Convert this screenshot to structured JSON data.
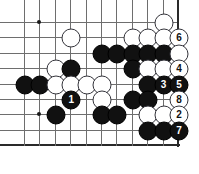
{
  "diagram": {
    "kind": "go-board-problem-diagram",
    "board": {
      "columns": 11,
      "rows": 9,
      "grid_spacing_px": 15.4,
      "origin": {
        "x": 24,
        "y": 22
      },
      "right_edge_is_board_border": true,
      "bottom_edge_is_board_border": true,
      "line_color": "#6e6e6e",
      "edge_color": "#2a2a2a",
      "background_color": "#ffffff"
    },
    "star_points": [
      {
        "col": 1,
        "row": 0
      },
      {
        "col": 1,
        "row": 6
      }
    ],
    "colors": {
      "black_stone": "#111111",
      "white_stone": "#ffffff",
      "white_stone_border": "#33333a",
      "black_label_text": "#ffffff",
      "white_label_text": "#111111"
    },
    "stones": [
      {
        "col": 9,
        "row": 0,
        "color": "white",
        "label": ""
      },
      {
        "col": 3,
        "row": 1,
        "color": "white",
        "label": ""
      },
      {
        "col": 7,
        "row": 1,
        "color": "white",
        "label": ""
      },
      {
        "col": 8,
        "row": 1,
        "color": "white",
        "label": ""
      },
      {
        "col": 9,
        "row": 1,
        "color": "white",
        "label": ""
      },
      {
        "col": 10,
        "row": 1,
        "color": "white",
        "label": "6"
      },
      {
        "col": 5,
        "row": 2,
        "color": "black",
        "label": ""
      },
      {
        "col": 6,
        "row": 2,
        "color": "black",
        "label": ""
      },
      {
        "col": 7,
        "row": 2,
        "color": "black",
        "label": ""
      },
      {
        "col": 8,
        "row": 2,
        "color": "black",
        "label": ""
      },
      {
        "col": 9,
        "row": 2,
        "color": "black",
        "label": ""
      },
      {
        "col": 10,
        "row": 2,
        "color": "white",
        "label": ""
      },
      {
        "col": 2,
        "row": 3,
        "color": "white",
        "label": ""
      },
      {
        "col": 3,
        "row": 3,
        "color": "black",
        "label": ""
      },
      {
        "col": 7,
        "row": 3,
        "color": "black",
        "label": ""
      },
      {
        "col": 8,
        "row": 3,
        "color": "white",
        "label": ""
      },
      {
        "col": 9,
        "row": 3,
        "color": "white",
        "label": ""
      },
      {
        "col": 10,
        "row": 3,
        "color": "white",
        "label": "4"
      },
      {
        "col": 0,
        "row": 4,
        "color": "black",
        "label": ""
      },
      {
        "col": 1,
        "row": 4,
        "color": "black",
        "label": ""
      },
      {
        "col": 2,
        "row": 4,
        "color": "white",
        "label": ""
      },
      {
        "col": 3,
        "row": 4,
        "color": "white",
        "label": ""
      },
      {
        "col": 4,
        "row": 4,
        "color": "white",
        "label": ""
      },
      {
        "col": 5,
        "row": 4,
        "color": "white",
        "label": ""
      },
      {
        "col": 8,
        "row": 4,
        "color": "black",
        "label": ""
      },
      {
        "col": 9,
        "row": 4,
        "color": "black",
        "label": "3"
      },
      {
        "col": 10,
        "row": 4,
        "color": "black",
        "label": "5"
      },
      {
        "col": 3,
        "row": 5,
        "color": "black",
        "label": "1"
      },
      {
        "col": 5,
        "row": 5,
        "color": "white",
        "label": ""
      },
      {
        "col": 7,
        "row": 5,
        "color": "black",
        "label": ""
      },
      {
        "col": 8,
        "row": 5,
        "color": "black",
        "label": ""
      },
      {
        "col": 10,
        "row": 5,
        "color": "white",
        "label": "8"
      },
      {
        "col": 2,
        "row": 6,
        "color": "black",
        "label": ""
      },
      {
        "col": 5,
        "row": 6,
        "color": "black",
        "label": ""
      },
      {
        "col": 6,
        "row": 6,
        "color": "black",
        "label": ""
      },
      {
        "col": 8,
        "row": 6,
        "color": "white",
        "label": ""
      },
      {
        "col": 9,
        "row": 6,
        "color": "white",
        "label": ""
      },
      {
        "col": 10,
        "row": 6,
        "color": "white",
        "label": "2"
      },
      {
        "col": 8,
        "row": 7,
        "color": "black",
        "label": ""
      },
      {
        "col": 9,
        "row": 7,
        "color": "black",
        "label": ""
      },
      {
        "col": 10,
        "row": 7,
        "color": "black",
        "label": "7"
      }
    ],
    "move_sequence": [
      {
        "number": "1",
        "color": "black"
      },
      {
        "number": "2",
        "color": "white"
      },
      {
        "number": "3",
        "color": "black"
      },
      {
        "number": "4",
        "color": "white"
      },
      {
        "number": "5",
        "color": "black"
      },
      {
        "number": "6",
        "color": "white"
      },
      {
        "number": "7",
        "color": "black"
      },
      {
        "number": "8",
        "color": "white"
      }
    ]
  }
}
